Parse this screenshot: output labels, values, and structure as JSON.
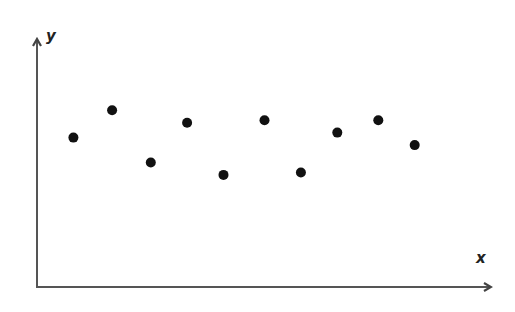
{
  "chart_data": {
    "type": "scatter",
    "title": "",
    "xlabel": "x",
    "ylabel": "y",
    "xlim": [
      0,
      10
    ],
    "ylim": [
      0,
      10
    ],
    "grid": false,
    "legend": null,
    "ticks": "none",
    "x": [
      0.8,
      1.65,
      2.5,
      3.3,
      4.1,
      5.0,
      5.8,
      6.6,
      7.5,
      8.3
    ],
    "y": [
      6.0,
      7.1,
      5.0,
      6.6,
      4.5,
      6.7,
      4.6,
      6.2,
      6.7,
      5.7
    ],
    "series": [
      {
        "name": "points",
        "color": "#111111",
        "points": [
          {
            "x": 0.8,
            "y": 6.0
          },
          {
            "x": 1.65,
            "y": 7.1
          },
          {
            "x": 2.5,
            "y": 5.0
          },
          {
            "x": 3.3,
            "y": 6.6
          },
          {
            "x": 4.1,
            "y": 4.5
          },
          {
            "x": 5.0,
            "y": 6.7
          },
          {
            "x": 5.8,
            "y": 4.6
          },
          {
            "x": 6.6,
            "y": 6.2
          },
          {
            "x": 7.5,
            "y": 6.7
          },
          {
            "x": 8.3,
            "y": 5.7
          }
        ]
      }
    ]
  },
  "axes": {
    "x_label": "x",
    "y_label": "y",
    "axis_color": "#555555",
    "point_color": "#111111"
  }
}
